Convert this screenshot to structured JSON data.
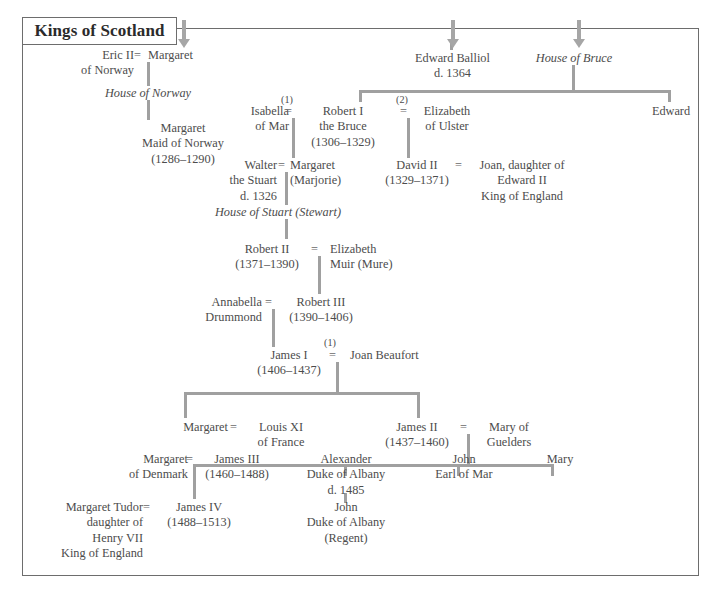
{
  "title": {
    "label": "Kings of Scotland"
  },
  "arrows": [
    {
      "name": "arrow-to-house-of-norway",
      "x": 178,
      "y": 20
    },
    {
      "name": "arrow-to-edward-balliol",
      "x": 447,
      "y": 20
    },
    {
      "name": "arrow-to-house-of-bruce",
      "x": 573,
      "y": 20
    }
  ],
  "houses": [
    {
      "id": "house-of-norway",
      "label": "House of Norway",
      "x": 78,
      "y": 86,
      "w": 140
    },
    {
      "id": "house-of-bruce",
      "label": "House of Bruce",
      "x": 515,
      "y": 51,
      "w": 118
    },
    {
      "id": "house-of-stuart",
      "label": "House of Stuart (Stewart)",
      "x": 190,
      "y": 205,
      "w": 176
    }
  ],
  "people": [
    {
      "id": "eric-ii-of-norway",
      "lines": [
        "Eric II",
        "of Norway"
      ],
      "x": 56,
      "y": 48,
      "w": 78,
      "align": "right"
    },
    {
      "id": "margaret-of-norway",
      "lines": [
        "Margaret"
      ],
      "x": 148,
      "y": 48,
      "w": 80,
      "align": "left"
    },
    {
      "id": "margaret-maid-of-norway",
      "lines": [
        "Margaret",
        "Maid of Norway",
        "(1286–1290)"
      ],
      "x": 118,
      "y": 121,
      "w": 130,
      "align": "center"
    },
    {
      "id": "edward-balliol",
      "lines": [
        "Edward Balliol",
        "d. 1364"
      ],
      "x": 400,
      "y": 51,
      "w": 105,
      "align": "center"
    },
    {
      "id": "isabella-of-mar",
      "lines": [
        "Isabella",
        "of Mar"
      ],
      "x": 232,
      "y": 104,
      "w": 57,
      "align": "right"
    },
    {
      "id": "robert-i-the-bruce",
      "lines": [
        "Robert I",
        "the Bruce",
        "(1306–1329)"
      ],
      "x": 297,
      "y": 104,
      "w": 92,
      "align": "center"
    },
    {
      "id": "elizabeth-of-ulster",
      "lines": [
        "Elizabeth",
        "of Ulster"
      ],
      "x": 412,
      "y": 104,
      "w": 70,
      "align": "center"
    },
    {
      "id": "edward-bruce",
      "lines": [
        "Edward"
      ],
      "x": 640,
      "y": 104,
      "w": 62,
      "align": "center"
    },
    {
      "id": "walter-the-stuart",
      "lines": [
        "Walter",
        "the Stuart",
        "d. 1326"
      ],
      "x": 212,
      "y": 158,
      "w": 65,
      "align": "right"
    },
    {
      "id": "margaret-marjorie",
      "lines": [
        "Margaret",
        "(Marjorie)"
      ],
      "x": 290,
      "y": 158,
      "w": 72,
      "align": "left"
    },
    {
      "id": "david-ii",
      "lines": [
        "David II",
        "(1329–1371)"
      ],
      "x": 378,
      "y": 158,
      "w": 78,
      "align": "center"
    },
    {
      "id": "joan-daughter-of-edward-ii",
      "lines": [
        "Joan, daughter of",
        "Edward II",
        "King of England"
      ],
      "x": 466,
      "y": 158,
      "w": 112,
      "align": "center"
    },
    {
      "id": "robert-ii",
      "lines": [
        "Robert II",
        "(1371–1390)"
      ],
      "x": 226,
      "y": 242,
      "w": 82,
      "align": "center"
    },
    {
      "id": "elizabeth-muir",
      "lines": [
        "Elizabeth",
        "Muir (Mure)"
      ],
      "x": 330,
      "y": 242,
      "w": 78,
      "align": "left"
    },
    {
      "id": "annabella-drummond",
      "lines": [
        "Annabella",
        "Drummond"
      ],
      "x": 190,
      "y": 295,
      "w": 72,
      "align": "right"
    },
    {
      "id": "robert-iii",
      "lines": [
        "Robert III",
        "(1390–1406)"
      ],
      "x": 280,
      "y": 295,
      "w": 82,
      "align": "center"
    },
    {
      "id": "james-i",
      "lines": [
        "James I",
        "(1406–1437)"
      ],
      "x": 248,
      "y": 348,
      "w": 82,
      "align": "center"
    },
    {
      "id": "joan-beaufort",
      "lines": [
        "Joan Beaufort"
      ],
      "x": 350,
      "y": 348,
      "w": 96,
      "align": "left"
    },
    {
      "id": "margaret-of-scotland",
      "lines": [
        "Margaret"
      ],
      "x": 160,
      "y": 420,
      "w": 68,
      "align": "right"
    },
    {
      "id": "louis-xi-of-france",
      "lines": [
        "Louis XI",
        "of France"
      ],
      "x": 248,
      "y": 420,
      "w": 66,
      "align": "center"
    },
    {
      "id": "james-ii",
      "lines": [
        "James II",
        "(1437–1460)"
      ],
      "x": 376,
      "y": 420,
      "w": 82,
      "align": "center"
    },
    {
      "id": "mary-of-guelders",
      "lines": [
        "Mary of",
        "Guelders"
      ],
      "x": 478,
      "y": 420,
      "w": 62,
      "align": "center"
    },
    {
      "id": "margaret-of-denmark",
      "lines": [
        "Margaret",
        "of Denmark"
      ],
      "x": 108,
      "y": 452,
      "w": 80,
      "align": "right"
    },
    {
      "id": "james-iii",
      "lines": [
        "James III",
        "(1460–1488)"
      ],
      "x": 196,
      "y": 452,
      "w": 82,
      "align": "center"
    },
    {
      "id": "alexander-duke-of-albany",
      "lines": [
        "Alexander",
        "Duke of Albany",
        "d. 1485"
      ],
      "x": 290,
      "y": 452,
      "w": 112,
      "align": "center"
    },
    {
      "id": "john-earl-of-mar",
      "lines": [
        "John",
        "Earl of Mar"
      ],
      "x": 424,
      "y": 452,
      "w": 80,
      "align": "center"
    },
    {
      "id": "mary-stewart",
      "lines": [
        "Mary"
      ],
      "x": 520,
      "y": 452,
      "w": 80,
      "align": "center"
    },
    {
      "id": "margaret-tudor",
      "lines": [
        "Margaret Tudor",
        "daughter of",
        "Henry VII",
        "King of England"
      ],
      "x": 30,
      "y": 500,
      "w": 113,
      "align": "right"
    },
    {
      "id": "james-iv",
      "lines": [
        "James IV",
        "(1488–1513)"
      ],
      "x": 158,
      "y": 500,
      "w": 82,
      "align": "center"
    },
    {
      "id": "john-duke-of-albany",
      "lines": [
        "John",
        "Duke of Albany",
        "(Regent)"
      ],
      "x": 290,
      "y": 500,
      "w": 112,
      "align": "center"
    }
  ],
  "marriages": [
    {
      "id": "eq-eric-margaret",
      "symbol": "=",
      "x": 134,
      "y": 48,
      "ordinal": null
    },
    {
      "id": "eq-isabella-robert",
      "symbol": "=",
      "x": 285,
      "y": 104,
      "ordinal": "(1)",
      "ord_x": 281,
      "ord_y": 94
    },
    {
      "id": "eq-robert-elizabeth",
      "symbol": "=",
      "x": 400,
      "y": 104,
      "ordinal": "(2)",
      "ord_x": 396,
      "ord_y": 94
    },
    {
      "id": "eq-walter-margaret",
      "symbol": "=",
      "x": 278,
      "y": 158,
      "ordinal": null
    },
    {
      "id": "eq-david-joan",
      "symbol": "=",
      "x": 455,
      "y": 158,
      "ordinal": null
    },
    {
      "id": "eq-robertii-elizabeth",
      "symbol": "=",
      "x": 311,
      "y": 242,
      "ordinal": null
    },
    {
      "id": "eq-annabella-robertiii",
      "symbol": "=",
      "x": 265,
      "y": 295,
      "ordinal": null
    },
    {
      "id": "eq-jamesi-joan",
      "symbol": "=",
      "x": 329,
      "y": 348,
      "ordinal": "(1)",
      "ord_x": 324,
      "ord_y": 337
    },
    {
      "id": "eq-margaret-louis",
      "symbol": "=",
      "x": 230,
      "y": 420,
      "ordinal": null
    },
    {
      "id": "eq-jamesii-mary",
      "symbol": "=",
      "x": 460,
      "y": 420,
      "ordinal": null
    },
    {
      "id": "eq-margaret-jamesiii",
      "symbol": "=",
      "x": 186,
      "y": 452,
      "ordinal": null
    },
    {
      "id": "eq-margarettudor-jamesiv",
      "symbol": "=",
      "x": 143,
      "y": 500,
      "ordinal": null
    }
  ],
  "vlines": [
    {
      "id": "v-eric-margaret-down",
      "x": 147,
      "y": 62,
      "h": 24
    },
    {
      "id": "v-norway-to-maid",
      "x": 147,
      "y": 100,
      "h": 20
    },
    {
      "id": "v-isabella-robert-down",
      "x": 292,
      "y": 118,
      "h": 40
    },
    {
      "id": "v-robert-elizabeth-down",
      "x": 407,
      "y": 118,
      "h": 40
    },
    {
      "id": "v-bruce-to-bar",
      "x": 572,
      "y": 65,
      "h": 25
    },
    {
      "id": "v-balliol-stub",
      "x": 450,
      "y": 40,
      "h": 10
    },
    {
      "id": "v-bar-left-stub",
      "x": 359,
      "y": 90,
      "h": 12
    },
    {
      "id": "v-bar-right-stub",
      "x": 668,
      "y": 90,
      "h": 12
    },
    {
      "id": "v-walter-margaret-down",
      "x": 285,
      "y": 172,
      "h": 33
    },
    {
      "id": "v-stuart-to-robertii",
      "x": 285,
      "y": 219,
      "h": 20
    },
    {
      "id": "v-robertii-down",
      "x": 318,
      "y": 256,
      "h": 38
    },
    {
      "id": "v-robertiii-down",
      "x": 272,
      "y": 309,
      "h": 38
    },
    {
      "id": "v-jamesi-down",
      "x": 336,
      "y": 362,
      "h": 30
    },
    {
      "id": "v-j1-left-stub",
      "x": 184,
      "y": 392,
      "h": 26
    },
    {
      "id": "v-j1-right-stub",
      "x": 417,
      "y": 392,
      "h": 26
    },
    {
      "id": "v-jamesii-down",
      "x": 467,
      "y": 434,
      "h": 30
    },
    {
      "id": "v-j2-stub-jamesiii",
      "x": 193,
      "y": 464,
      "h": 12
    },
    {
      "id": "v-j2-stub-alexander",
      "x": 344,
      "y": 464,
      "h": 12
    },
    {
      "id": "v-j2-stub-john",
      "x": 457,
      "y": 464,
      "h": 12
    },
    {
      "id": "v-j2-stub-mary",
      "x": 551,
      "y": 464,
      "h": 12
    },
    {
      "id": "v-margaret-jamesiii-down",
      "x": 193,
      "y": 466,
      "h": 33
    },
    {
      "id": "v-alexander-to-john",
      "x": 344,
      "y": 493,
      "h": 10
    }
  ],
  "hlines": [
    {
      "id": "h-bruce-children",
      "x": 359,
      "y": 90,
      "w": 310
    },
    {
      "id": "h-jamesi-children",
      "x": 184,
      "y": 392,
      "w": 234
    },
    {
      "id": "h-jamesii-children",
      "x": 193,
      "y": 464,
      "w": 359
    }
  ],
  "colors": {
    "line": "#a0a0a0",
    "text": "#4c4c4c",
    "frame": "#6d6d6d",
    "title": "#2b2b2b",
    "background": "#ffffff"
  }
}
